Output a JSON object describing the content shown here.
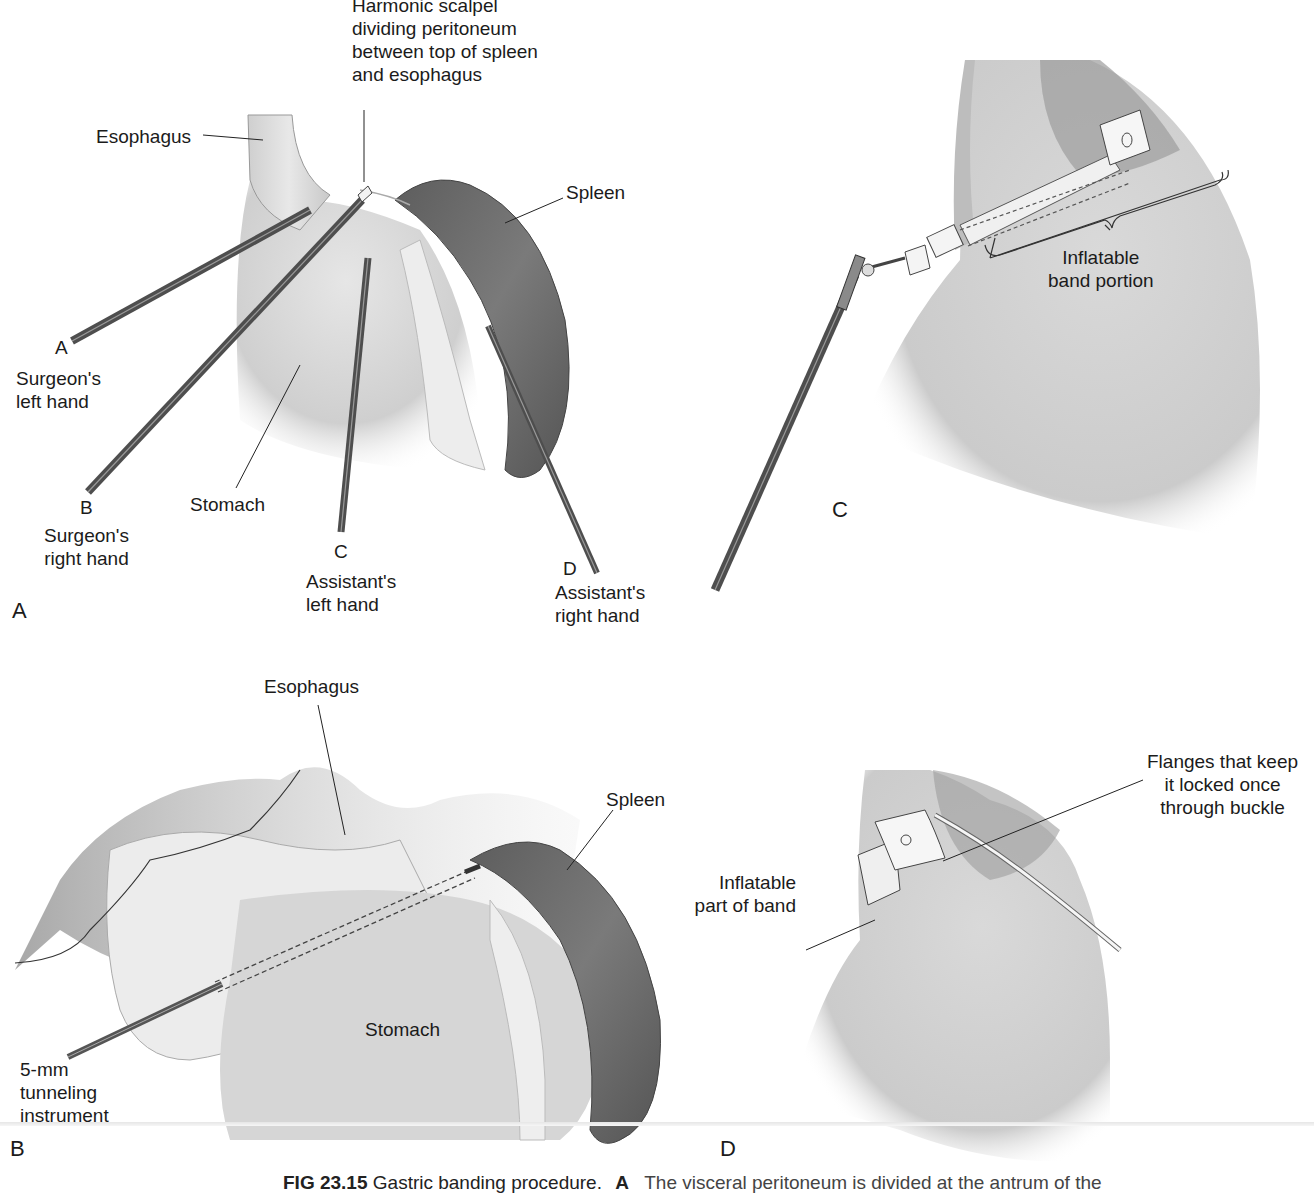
{
  "figure": {
    "caption": {
      "number": "FIG 23.15",
      "title": "Gastric banding procedure.",
      "panel_ref": "A",
      "text": "The visceral peritoneum is divided at the antrum of the"
    },
    "panels": [
      {
        "id": "A",
        "letter": "A",
        "labels": {
          "harmonic_scalpel": [
            "Harmonic scalpel",
            "dividing peritoneum",
            "between top of spleen",
            "and esophagus"
          ],
          "esophagus": "Esophagus",
          "spleen": "Spleen",
          "stomach": "Stomach",
          "instrument_a_letter": "A",
          "instrument_a_desc": [
            "Surgeon's",
            "left hand"
          ],
          "instrument_b_letter": "B",
          "instrument_b_desc": [
            "Surgeon's",
            "right hand"
          ],
          "instrument_c_letter": "C",
          "instrument_c_desc": [
            "Assistant's",
            "left hand"
          ],
          "instrument_d_letter": "D",
          "instrument_d_desc": [
            "Assistant's",
            "right hand"
          ]
        }
      },
      {
        "id": "B",
        "letter": "B",
        "labels": {
          "esophagus": "Esophagus",
          "spleen": "Spleen",
          "stomach": "Stomach",
          "tunneling": [
            "5-mm",
            "tunneling",
            "instrument"
          ]
        }
      },
      {
        "id": "C",
        "letter": "C",
        "labels": {
          "inflatable_band": [
            "Inflatable",
            "band portion"
          ]
        }
      },
      {
        "id": "D",
        "letter": "D",
        "labels": {
          "flanges": [
            "Flanges that keep",
            "it locked once",
            "through buckle"
          ],
          "inflatable_part": [
            "Inflatable",
            "part of band"
          ]
        }
      }
    ],
    "colors": {
      "tissue": "#d4d4d4",
      "spleen": "#6a6a6a",
      "instrument": "#5a5a5a",
      "omentum": "#ececec"
    }
  }
}
